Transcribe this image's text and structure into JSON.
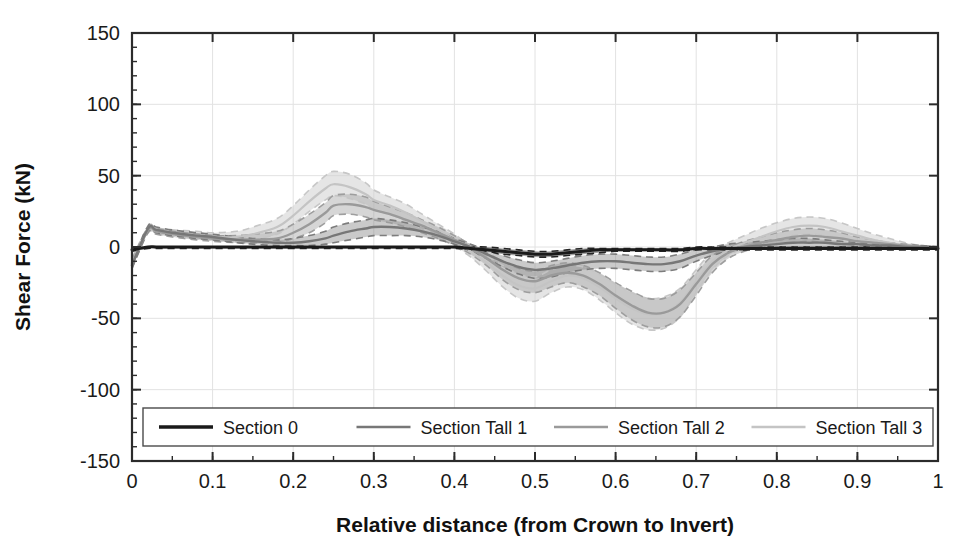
{
  "chart_data": {
    "type": "line",
    "title": "",
    "xlabel": "Relative distance (from Crown to Invert)",
    "ylabel": "Shear Force (kN)",
    "xlim": [
      0,
      1
    ],
    "ylim": [
      -150,
      150
    ],
    "x_ticks": [
      "0",
      "0.1",
      "0.2",
      "0.3",
      "0.4",
      "0.5",
      "0.6",
      "0.7",
      "0.8",
      "0.9",
      "1"
    ],
    "x_tick_values": [
      0,
      0.1,
      0.2,
      0.3,
      0.4,
      0.5,
      0.6,
      0.7,
      0.8,
      0.9,
      1
    ],
    "x_minor_step": 0.05,
    "y_ticks": [
      "150",
      "100",
      "50",
      "0",
      "-50",
      "-100",
      "-150"
    ],
    "y_tick_values": [
      150,
      100,
      50,
      0,
      -50,
      -100,
      -150
    ],
    "y_minor_step": 10,
    "grid": true,
    "legend_position": "bottom-inside",
    "x": [
      0,
      0.02,
      0.03,
      0.05,
      0.08,
      0.1,
      0.13,
      0.15,
      0.18,
      0.2,
      0.22,
      0.24,
      0.25,
      0.27,
      0.29,
      0.3,
      0.32,
      0.34,
      0.36,
      0.38,
      0.4,
      0.42,
      0.44,
      0.46,
      0.48,
      0.5,
      0.52,
      0.54,
      0.56,
      0.58,
      0.6,
      0.62,
      0.64,
      0.66,
      0.68,
      0.7,
      0.72,
      0.74,
      0.76,
      0.78,
      0.8,
      0.82,
      0.84,
      0.86,
      0.88,
      0.9,
      0.92,
      0.94,
      0.96,
      0.98,
      1
    ],
    "series": [
      {
        "name": "Section 0",
        "color": "#1a1a1a",
        "linewidth": 3.0,
        "values": [
          -2,
          0,
          0,
          0,
          0,
          0,
          0,
          0,
          0,
          0,
          0,
          0,
          0,
          0,
          0,
          0,
          0,
          0,
          0,
          0,
          0,
          -1,
          -2,
          -3,
          -4,
          -5,
          -5,
          -4,
          -3,
          -2,
          -2,
          -2,
          -2,
          -2,
          -2,
          -1,
          -1,
          -1,
          -1,
          -1,
          -1,
          -1,
          -1,
          -1,
          -1,
          -1,
          -1,
          -1,
          -1,
          -1,
          -1
        ],
        "band_upper": [
          -2,
          0,
          0,
          0,
          0,
          0,
          0,
          0,
          0,
          0,
          0,
          0,
          0,
          0,
          0,
          0,
          0,
          0,
          0,
          0,
          0,
          0,
          0,
          -1,
          -2,
          -3,
          -3,
          -2,
          -1,
          -1,
          -1,
          -1,
          -1,
          -1,
          -1,
          0,
          0,
          0,
          0,
          0,
          0,
          0,
          0,
          0,
          0,
          0,
          0,
          0,
          0,
          0,
          0
        ],
        "band_lower": [
          -3,
          -1,
          -1,
          -1,
          -1,
          -1,
          -1,
          -1,
          -1,
          -1,
          -1,
          -1,
          -1,
          -1,
          -1,
          -1,
          -1,
          -1,
          -1,
          -1,
          -1,
          -2,
          -3,
          -5,
          -6,
          -7,
          -7,
          -6,
          -5,
          -4,
          -3,
          -3,
          -3,
          -3,
          -3,
          -2,
          -2,
          -2,
          -2,
          -2,
          -2,
          -2,
          -2,
          -2,
          -2,
          -2,
          -2,
          -2,
          -2,
          -2,
          -2
        ]
      },
      {
        "name": "Section Tall 1",
        "color": "#777777",
        "linewidth": 2.4,
        "values": [
          -13,
          13,
          12,
          10,
          8,
          7,
          5,
          4,
          3,
          3,
          4,
          6,
          8,
          11,
          13,
          14,
          14,
          13,
          11,
          8,
          4,
          0,
          -5,
          -10,
          -14,
          -16,
          -15,
          -13,
          -11,
          -10,
          -10,
          -11,
          -12,
          -12,
          -10,
          -6,
          -3,
          -1,
          0,
          1,
          2,
          3,
          3,
          3,
          2,
          2,
          1,
          1,
          0,
          0,
          0
        ],
        "band_upper": [
          -11,
          15,
          14,
          12,
          10,
          9,
          7,
          6,
          5,
          6,
          8,
          11,
          14,
          17,
          19,
          20,
          19,
          17,
          14,
          11,
          6,
          2,
          -2,
          -6,
          -9,
          -11,
          -10,
          -8,
          -6,
          -5,
          -5,
          -6,
          -7,
          -7,
          -5,
          -2,
          0,
          2,
          3,
          4,
          5,
          6,
          6,
          5,
          4,
          3,
          2,
          2,
          1,
          1,
          0
        ],
        "band_lower": [
          -15,
          11,
          10,
          8,
          6,
          5,
          3,
          2,
          1,
          1,
          1,
          2,
          3,
          5,
          7,
          8,
          8,
          8,
          7,
          5,
          2,
          -3,
          -8,
          -14,
          -19,
          -22,
          -21,
          -18,
          -16,
          -15,
          -15,
          -16,
          -17,
          -17,
          -15,
          -10,
          -6,
          -3,
          -2,
          -1,
          0,
          0,
          0,
          0,
          0,
          0,
          0,
          0,
          0,
          0,
          0
        ]
      },
      {
        "name": "Section Tall 2",
        "color": "#9a9a9a",
        "linewidth": 2.4,
        "values": [
          -12,
          12,
          11,
          9,
          7,
          6,
          5,
          5,
          6,
          10,
          16,
          24,
          29,
          30,
          28,
          26,
          23,
          19,
          15,
          10,
          5,
          -1,
          -8,
          -16,
          -22,
          -24,
          -20,
          -18,
          -20,
          -26,
          -34,
          -41,
          -46,
          -46,
          -40,
          -26,
          -12,
          -4,
          0,
          3,
          5,
          7,
          8,
          7,
          6,
          4,
          3,
          2,
          1,
          0,
          0
        ],
        "band_upper": [
          -9,
          14,
          13,
          11,
          9,
          8,
          8,
          9,
          11,
          16,
          23,
          31,
          36,
          37,
          35,
          32,
          28,
          24,
          19,
          14,
          8,
          2,
          -4,
          -10,
          -15,
          -17,
          -13,
          -11,
          -13,
          -18,
          -25,
          -31,
          -36,
          -36,
          -30,
          -18,
          -6,
          0,
          4,
          7,
          10,
          12,
          13,
          12,
          10,
          7,
          5,
          3,
          2,
          1,
          0
        ],
        "band_lower": [
          -15,
          10,
          9,
          7,
          5,
          4,
          3,
          3,
          3,
          6,
          10,
          17,
          22,
          23,
          21,
          19,
          17,
          14,
          10,
          6,
          1,
          -5,
          -13,
          -23,
          -30,
          -32,
          -28,
          -25,
          -28,
          -34,
          -43,
          -51,
          -56,
          -56,
          -49,
          -34,
          -18,
          -8,
          -3,
          0,
          2,
          3,
          4,
          3,
          2,
          1,
          1,
          0,
          0,
          0,
          0
        ]
      },
      {
        "name": "Section Tall 3",
        "color": "#c4c4c4",
        "linewidth": 2.2,
        "values": [
          -11,
          12,
          11,
          10,
          8,
          7,
          7,
          9,
          14,
          22,
          32,
          41,
          44,
          42,
          37,
          33,
          29,
          24,
          18,
          12,
          5,
          -3,
          -11,
          -20,
          -27,
          -29,
          -24,
          -20,
          -22,
          -28,
          -36,
          -43,
          -47,
          -46,
          -39,
          -24,
          -10,
          -2,
          3,
          7,
          11,
          14,
          15,
          14,
          11,
          8,
          5,
          3,
          1,
          0,
          0
        ],
        "band_upper": [
          -8,
          14,
          13,
          12,
          11,
          10,
          11,
          14,
          20,
          29,
          40,
          50,
          53,
          51,
          45,
          40,
          35,
          30,
          23,
          16,
          9,
          1,
          -6,
          -13,
          -19,
          -21,
          -16,
          -13,
          -14,
          -19,
          -26,
          -32,
          -36,
          -35,
          -29,
          -16,
          -3,
          3,
          8,
          13,
          17,
          20,
          21,
          20,
          17,
          13,
          9,
          6,
          3,
          1,
          0
        ],
        "band_lower": [
          -14,
          10,
          9,
          8,
          6,
          5,
          4,
          5,
          9,
          16,
          25,
          33,
          36,
          34,
          30,
          26,
          23,
          18,
          13,
          8,
          1,
          -7,
          -17,
          -28,
          -36,
          -38,
          -32,
          -28,
          -30,
          -37,
          -46,
          -54,
          -58,
          -57,
          -49,
          -32,
          -16,
          -6,
          -1,
          2,
          5,
          8,
          9,
          8,
          6,
          4,
          2,
          1,
          0,
          0,
          0
        ]
      }
    ],
    "legend": [
      {
        "label": "Section 0",
        "color": "#1a1a1a"
      },
      {
        "label": "Section Tall 1",
        "color": "#777777"
      },
      {
        "label": "Section Tall 2",
        "color": "#9a9a9a"
      },
      {
        "label": "Section Tall 3",
        "color": "#c4c4c4"
      }
    ]
  }
}
